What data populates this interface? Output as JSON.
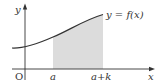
{
  "figure": {
    "type": "function-graph",
    "axes": {
      "x_label": "x",
      "y_label": "y",
      "origin_label": "O"
    },
    "curve_label": "y = f(x)",
    "x_ticks": [
      "a",
      "a+k"
    ],
    "shaded_region": {
      "from": "a",
      "to": "a+k",
      "color": "#dcdcdc"
    },
    "colors": {
      "curve": "#333333",
      "axes": "#333333",
      "shade": "#dcdcdc",
      "background": "#ffffff"
    }
  }
}
